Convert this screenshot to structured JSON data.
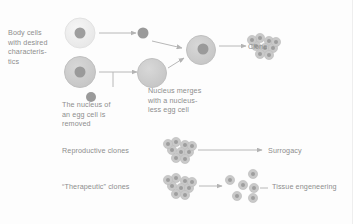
{
  "figure": {
    "title_alt": "Cloning process diagram",
    "background_color": "#fdfdfd",
    "text_color": "#8d8d8d",
    "cell_fill_light": "#ededed",
    "cell_fill_mid": "#cfcfcf",
    "cell_fill_dark": "#bdbdbd",
    "nucleus_fill": "#9a9a9a",
    "arrow_color": "#b3b3b3"
  },
  "labels": {
    "body_cells": "Body cells\nwith desired\ncharacteris-\ntics",
    "nucleus_removed": "The nucleus of\nan egg cell is\nremoved",
    "nucleus_merges": "Nucleus merges\nwith a nucleus-\nless egg cell",
    "clone": "Clone",
    "reproductive_clones": "Reproductive clones",
    "therapeutic_clones": "“Therapeutic” clones",
    "surrogacy": "Surrogacy",
    "tissue_engineering": "Tissue engeneering"
  },
  "shapes": {
    "donor_cell_top": {
      "cx": 80,
      "cy": 33,
      "r": 15,
      "nucleus_r": 5.5
    },
    "extracted_nucleus": {
      "cx": 143,
      "cy": 33,
      "r": 5.5
    },
    "egg_cell": {
      "cx": 80,
      "cy": 72,
      "r": 15,
      "nucleus_r": 5.5
    },
    "discarded_nucleus": {
      "cx": 91,
      "cy": 97,
      "r": 5
    },
    "enucleated_egg": {
      "cx": 152,
      "cy": 74,
      "r": 14
    },
    "fused_cell": {
      "cx": 200,
      "cy": 51,
      "r": 14,
      "nucleus_r": 5.5
    },
    "clone_cluster": {
      "cx": 228,
      "cy": 44,
      "count": 9,
      "r": 4.4
    },
    "reproductive_cluster": {
      "cx": 178,
      "cy": 150,
      "count": 9,
      "r": 4.4
    },
    "therapeutic_cluster": {
      "cx": 178,
      "cy": 186,
      "count": 9,
      "r": 4.4
    },
    "dispersed_cells": {
      "count": 6,
      "r": 4.4
    }
  },
  "arrows": [
    {
      "name": "nucleus-extraction-arrow",
      "x1": 99,
      "y1": 33,
      "x2": 134,
      "y2": 33
    },
    {
      "name": "egg-enucleation-arrow",
      "x1": 99,
      "y1": 72,
      "x2": 135,
      "y2": 72
    },
    {
      "name": "nucleus-to-fusion-arrow",
      "x1": 152,
      "y1": 40,
      "x2": 184,
      "y2": 46
    },
    {
      "name": "egg-to-fusion-arrow",
      "x1": 167,
      "y1": 70,
      "x2": 186,
      "y2": 58
    },
    {
      "name": "fusion-to-clone-arrow",
      "x1": 216,
      "y1": 46,
      "x2": 248,
      "y2": 46
    },
    {
      "name": "reproductive-to-surrogacy-arrow",
      "x1": 194,
      "y1": 150,
      "x2": 264,
      "y2": 150
    },
    {
      "name": "therapeutic-to-cells-arrow",
      "x1": 194,
      "y1": 186,
      "x2": 224,
      "y2": 186
    },
    {
      "name": "cells-to-tissue-arrow",
      "x1": 250,
      "y1": 186,
      "x2": 266,
      "y2": 186
    }
  ]
}
